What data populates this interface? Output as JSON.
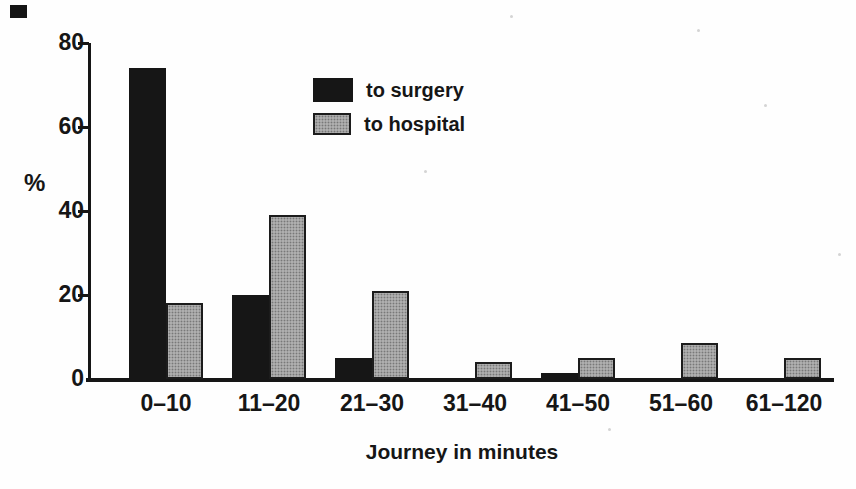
{
  "chart_data": {
    "type": "bar",
    "categories": [
      "0–10",
      "11–20",
      "21–30",
      "31–40",
      "41–50",
      "51–60",
      "61–120"
    ],
    "series": [
      {
        "name": "to surgery",
        "color": "#161616",
        "values": [
          74,
          20,
          5,
          0,
          1.5,
          0,
          0
        ]
      },
      {
        "name": "to hospital",
        "color": "#aeaeae",
        "values": [
          18,
          39,
          21,
          4,
          5,
          8.5,
          5
        ]
      }
    ],
    "title": "",
    "xlabel": "Journey in minutes",
    "ylabel": "%",
    "ylim": [
      0,
      80
    ],
    "yticks": [
      0,
      20,
      40,
      60,
      80
    ],
    "grid": false,
    "legend_position": "inside-upper-center"
  }
}
